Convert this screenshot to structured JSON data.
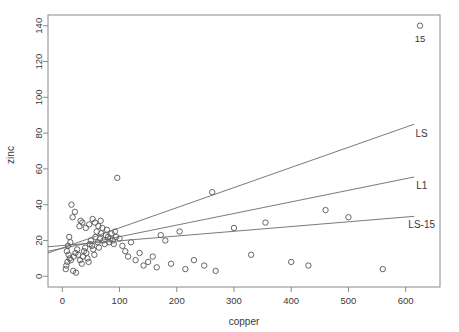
{
  "chart_data": {
    "type": "scatter",
    "title": "",
    "xlabel": "copper",
    "ylabel": "zinc",
    "xlim": [
      -25,
      660
    ],
    "ylim": [
      -6,
      146
    ],
    "xticks": [
      0,
      100,
      200,
      300,
      400,
      500,
      600
    ],
    "yticks": [
      0,
      20,
      40,
      60,
      80,
      100,
      120,
      140
    ],
    "grid": false,
    "legend": "inline-right-labels",
    "points": [
      {
        "x": 85,
        "y": 1022
      },
      {
        "x": 16,
        "y": 40
      },
      {
        "x": 18,
        "y": 33
      },
      {
        "x": 22,
        "y": 36
      },
      {
        "x": 30,
        "y": 28
      },
      {
        "x": 32,
        "y": 31
      },
      {
        "x": 12,
        "y": 22
      },
      {
        "x": 14,
        "y": 19
      },
      {
        "x": 10,
        "y": 17
      },
      {
        "x": 8,
        "y": 14
      },
      {
        "x": 11,
        "y": 12
      },
      {
        "x": 13,
        "y": 10
      },
      {
        "x": 15,
        "y": 9
      },
      {
        "x": 9,
        "y": 8
      },
      {
        "x": 7,
        "y": 6
      },
      {
        "x": 6,
        "y": 4
      },
      {
        "x": 19,
        "y": 3
      },
      {
        "x": 24,
        "y": 2
      },
      {
        "x": 20,
        "y": 11
      },
      {
        "x": 23,
        "y": 13
      },
      {
        "x": 26,
        "y": 15
      },
      {
        "x": 28,
        "y": 12
      },
      {
        "x": 31,
        "y": 9
      },
      {
        "x": 34,
        "y": 7
      },
      {
        "x": 36,
        "y": 11
      },
      {
        "x": 38,
        "y": 14
      },
      {
        "x": 40,
        "y": 16
      },
      {
        "x": 42,
        "y": 13
      },
      {
        "x": 44,
        "y": 10
      },
      {
        "x": 46,
        "y": 8
      },
      {
        "x": 48,
        "y": 18
      },
      {
        "x": 50,
        "y": 20
      },
      {
        "x": 52,
        "y": 17
      },
      {
        "x": 54,
        "y": 15
      },
      {
        "x": 56,
        "y": 12
      },
      {
        "x": 58,
        "y": 22
      },
      {
        "x": 60,
        "y": 25
      },
      {
        "x": 62,
        "y": 19
      },
      {
        "x": 64,
        "y": 16
      },
      {
        "x": 66,
        "y": 21
      },
      {
        "x": 68,
        "y": 24
      },
      {
        "x": 70,
        "y": 27
      },
      {
        "x": 72,
        "y": 20
      },
      {
        "x": 74,
        "y": 18
      },
      {
        "x": 76,
        "y": 23
      },
      {
        "x": 78,
        "y": 26
      },
      {
        "x": 80,
        "y": 22
      },
      {
        "x": 82,
        "y": 19
      },
      {
        "x": 84,
        "y": 21
      },
      {
        "x": 86,
        "y": 24
      },
      {
        "x": 88,
        "y": 20
      },
      {
        "x": 90,
        "y": 18
      },
      {
        "x": 92,
        "y": 25
      },
      {
        "x": 94,
        "y": 22
      },
      {
        "x": 96,
        "y": 55
      },
      {
        "x": 35,
        "y": 30
      },
      {
        "x": 41,
        "y": 27
      },
      {
        "x": 47,
        "y": 29
      },
      {
        "x": 53,
        "y": 32
      },
      {
        "x": 57,
        "y": 30
      },
      {
        "x": 63,
        "y": 28
      },
      {
        "x": 67,
        "y": 31
      },
      {
        "x": 100,
        "y": 21
      },
      {
        "x": 105,
        "y": 17
      },
      {
        "x": 110,
        "y": 14
      },
      {
        "x": 115,
        "y": 11
      },
      {
        "x": 120,
        "y": 19
      },
      {
        "x": 128,
        "y": 9
      },
      {
        "x": 135,
        "y": 13
      },
      {
        "x": 142,
        "y": 6
      },
      {
        "x": 150,
        "y": 8
      },
      {
        "x": 158,
        "y": 11
      },
      {
        "x": 165,
        "y": 5
      },
      {
        "x": 172,
        "y": 23
      },
      {
        "x": 180,
        "y": 20
      },
      {
        "x": 190,
        "y": 7
      },
      {
        "x": 205,
        "y": 25
      },
      {
        "x": 215,
        "y": 4
      },
      {
        "x": 230,
        "y": 9
      },
      {
        "x": 248,
        "y": 6
      },
      {
        "x": 262,
        "y": 47
      },
      {
        "x": 268,
        "y": 3
      },
      {
        "x": 300,
        "y": 27
      },
      {
        "x": 330,
        "y": 12
      },
      {
        "x": 355,
        "y": 30
      },
      {
        "x": 400,
        "y": 8
      },
      {
        "x": 430,
        "y": 6
      },
      {
        "x": 460,
        "y": 37
      },
      {
        "x": 500,
        "y": 33
      },
      {
        "x": 560,
        "y": 4
      },
      {
        "x": 625,
        "y": 140
      }
    ],
    "point_annotations": [
      {
        "label": "15",
        "x": 625,
        "y": 140,
        "dx": 0,
        "dy": -16
      }
    ],
    "lines": [
      {
        "name": "LS",
        "x0": -25,
        "y0": 13.0,
        "x1": 615,
        "y1": 85.0,
        "label": "LS",
        "label_x": 628,
        "label_y": 78
      },
      {
        "name": "L1",
        "x0": -25,
        "y0": 14.0,
        "x1": 615,
        "y1": 55.5,
        "label": "L1",
        "label_x": 628,
        "label_y": 49
      },
      {
        "name": "LS-15",
        "x0": -25,
        "y0": 16.5,
        "x1": 615,
        "y1": 33.5,
        "label": "LS-15",
        "label_x": 628,
        "label_y": 27
      }
    ]
  },
  "colors": {
    "background": "#ffffff",
    "frame": "#8a8a8a",
    "point": "#555555",
    "line": "#6b6b6b",
    "text": "#3a3a3a"
  }
}
